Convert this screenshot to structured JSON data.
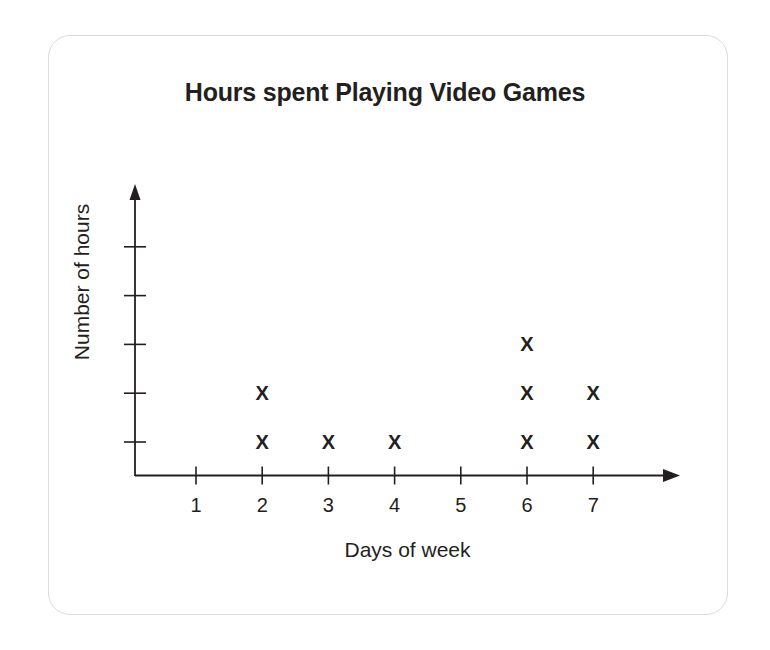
{
  "card": {
    "border_color": "#dcdcdc"
  },
  "chart_data": {
    "type": "scatter",
    "plot_style": "dot-plot-x-marks",
    "title": "Hours spent Playing Video Games",
    "xlabel": "Days of week",
    "ylabel": "Number of hours",
    "x_tick_labels": [
      "1",
      "2",
      "3",
      "4",
      "5",
      "6",
      "7"
    ],
    "x": [
      1,
      2,
      3,
      4,
      5,
      6,
      7
    ],
    "xlim": [
      0,
      7.6
    ],
    "y_tick_labels": [
      "",
      "",
      "",
      "",
      ""
    ],
    "y_tick_values": [
      1,
      2,
      3,
      4,
      5
    ],
    "ylim": [
      0,
      5.6
    ],
    "grid": false,
    "legend": null,
    "marker": "X",
    "axis_color": "#231f20",
    "marker_color": "#231f20",
    "categories": [
      "1",
      "2",
      "3",
      "4",
      "5",
      "6",
      "7"
    ],
    "values": [
      0,
      2,
      1,
      1,
      0,
      3,
      2
    ],
    "points": [
      {
        "x": 2,
        "y": 1
      },
      {
        "x": 2,
        "y": 2
      },
      {
        "x": 3,
        "y": 1
      },
      {
        "x": 4,
        "y": 1
      },
      {
        "x": 6,
        "y": 1
      },
      {
        "x": 6,
        "y": 2
      },
      {
        "x": 6,
        "y": 3
      },
      {
        "x": 7,
        "y": 1
      },
      {
        "x": 7,
        "y": 2
      }
    ]
  }
}
